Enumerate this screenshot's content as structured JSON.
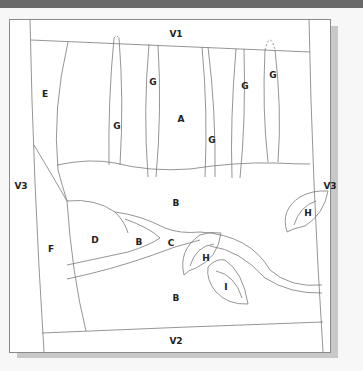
{
  "diagram": {
    "type": "applique-quilt-pattern",
    "colors": {
      "line": "#7a7a7a",
      "label": "#222222",
      "background": "#ffffff",
      "frame_shadow": "#c8c8c8"
    },
    "labels": [
      {
        "id": "v1",
        "text": "V1",
        "x": 176,
        "y": 34
      },
      {
        "id": "v2",
        "text": "V2",
        "x": 176,
        "y": 341
      },
      {
        "id": "v3-left",
        "text": "V3",
        "x": 21,
        "y": 186
      },
      {
        "id": "v3-right",
        "text": "V3",
        "x": 330,
        "y": 186
      },
      {
        "id": "e",
        "text": "E",
        "x": 45,
        "y": 94
      },
      {
        "id": "f",
        "text": "F",
        "x": 51,
        "y": 249
      },
      {
        "id": "a",
        "text": "A",
        "x": 181,
        "y": 119
      },
      {
        "id": "g1",
        "text": "G",
        "x": 117,
        "y": 126
      },
      {
        "id": "g2",
        "text": "G",
        "x": 153,
        "y": 82
      },
      {
        "id": "g3",
        "text": "G",
        "x": 212,
        "y": 140
      },
      {
        "id": "g4",
        "text": "G",
        "x": 245,
        "y": 86
      },
      {
        "id": "g5",
        "text": "G",
        "x": 273,
        "y": 75
      },
      {
        "id": "b-top",
        "text": "B",
        "x": 176,
        "y": 203
      },
      {
        "id": "b-mid",
        "text": "B",
        "x": 139,
        "y": 242
      },
      {
        "id": "b-bottom",
        "text": "B",
        "x": 176,
        "y": 298
      },
      {
        "id": "c",
        "text": "C",
        "x": 171,
        "y": 243
      },
      {
        "id": "d",
        "text": "D",
        "x": 95,
        "y": 240
      },
      {
        "id": "h-center",
        "text": "H",
        "x": 206,
        "y": 258
      },
      {
        "id": "h-right",
        "text": "H",
        "x": 308,
        "y": 213
      },
      {
        "id": "i",
        "text": "I",
        "x": 226,
        "y": 287
      }
    ]
  }
}
